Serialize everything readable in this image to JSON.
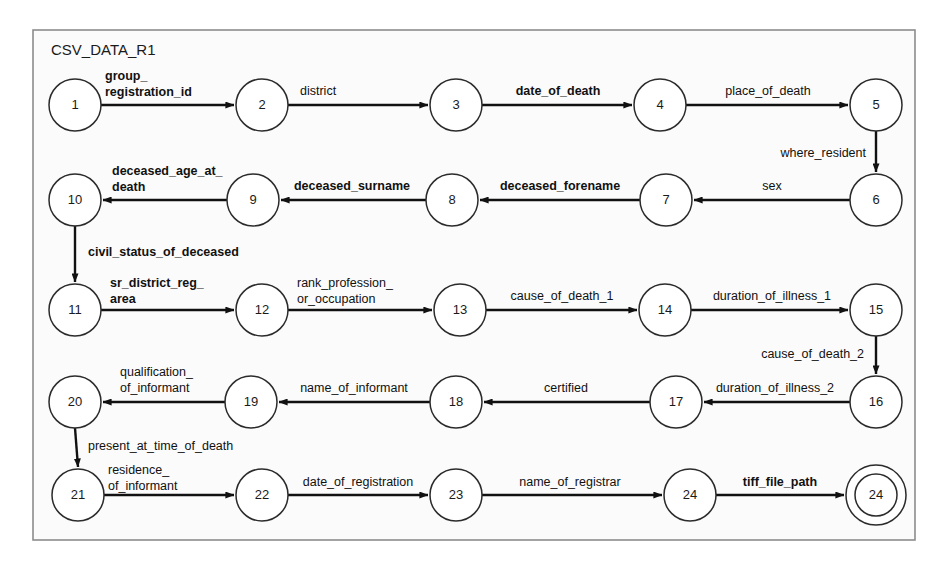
{
  "diagram": {
    "title": "CSV_DATA_R1",
    "type": "finite-state-machine",
    "frame": {
      "x": 33,
      "y": 30,
      "width": 882,
      "height": 510,
      "border_color": "#8d8d8d",
      "fill_color": "#fbfbfb"
    },
    "node_radius": 26,
    "accepting_inner_radius": 21,
    "edge_color": "#111111",
    "node_stroke_color": "#2b2b2b",
    "nodes": [
      {
        "id": "n1",
        "label": "1",
        "cx": 75,
        "cy": 105,
        "accepting": false
      },
      {
        "id": "n2",
        "label": "2",
        "cx": 262,
        "cy": 105,
        "accepting": false
      },
      {
        "id": "n3",
        "label": "3",
        "cx": 456,
        "cy": 105,
        "accepting": false
      },
      {
        "id": "n4",
        "label": "4",
        "cx": 660,
        "cy": 105,
        "accepting": false
      },
      {
        "id": "n5",
        "label": "5",
        "cx": 876,
        "cy": 105,
        "accepting": false
      },
      {
        "id": "n6",
        "label": "6",
        "cx": 876,
        "cy": 200,
        "accepting": false
      },
      {
        "id": "n7",
        "label": "7",
        "cx": 666,
        "cy": 200,
        "accepting": false
      },
      {
        "id": "n8",
        "label": "8",
        "cx": 452,
        "cy": 200,
        "accepting": false
      },
      {
        "id": "n9",
        "label": "9",
        "cx": 253,
        "cy": 200,
        "accepting": false
      },
      {
        "id": "n10",
        "label": "10",
        "cx": 75,
        "cy": 200,
        "accepting": false
      },
      {
        "id": "n11",
        "label": "11",
        "cx": 75,
        "cy": 310,
        "accepting": false
      },
      {
        "id": "n12",
        "label": "12",
        "cx": 262,
        "cy": 310,
        "accepting": false
      },
      {
        "id": "n13",
        "label": "13",
        "cx": 460,
        "cy": 310,
        "accepting": false
      },
      {
        "id": "n14",
        "label": "14",
        "cx": 665,
        "cy": 310,
        "accepting": false
      },
      {
        "id": "n15",
        "label": "15",
        "cx": 876,
        "cy": 310,
        "accepting": false
      },
      {
        "id": "n16",
        "label": "16",
        "cx": 876,
        "cy": 402,
        "accepting": false
      },
      {
        "id": "n17",
        "label": "17",
        "cx": 676,
        "cy": 402,
        "accepting": false
      },
      {
        "id": "n18",
        "label": "18",
        "cx": 456,
        "cy": 402,
        "accepting": false
      },
      {
        "id": "n19",
        "label": "19",
        "cx": 251,
        "cy": 402,
        "accepting": false
      },
      {
        "id": "n20",
        "label": "20",
        "cx": 75,
        "cy": 402,
        "accepting": false
      },
      {
        "id": "n21",
        "label": "21",
        "cx": 78,
        "cy": 495,
        "accepting": false
      },
      {
        "id": "n22",
        "label": "22",
        "cx": 262,
        "cy": 495,
        "accepting": false
      },
      {
        "id": "n23",
        "label": "23",
        "cx": 456,
        "cy": 495,
        "accepting": false
      },
      {
        "id": "n24",
        "label": "24",
        "cx": 690,
        "cy": 495,
        "accepting": false
      },
      {
        "id": "n24f",
        "label": "24",
        "cx": 876,
        "cy": 495,
        "accepting": true
      }
    ],
    "edges": [
      {
        "id": "e1",
        "from": "n1",
        "to": "n2",
        "label": "group_\nregistration_id",
        "bold": true,
        "dir": "right",
        "label_x": 105,
        "label_y": 80,
        "anchor": "start"
      },
      {
        "id": "e2",
        "from": "n2",
        "to": "n3",
        "label": "district",
        "bold": false,
        "dir": "right",
        "label_x": 300,
        "label_y": 95,
        "anchor": "start"
      },
      {
        "id": "e3",
        "from": "n3",
        "to": "n4",
        "label": "date_of_death",
        "bold": true,
        "dir": "right",
        "label_x": 558,
        "label_y": 95,
        "anchor": "middle"
      },
      {
        "id": "e4",
        "from": "n4",
        "to": "n5",
        "label": "place_of_death",
        "bold": false,
        "dir": "right",
        "label_x": 768,
        "label_y": 95,
        "anchor": "middle"
      },
      {
        "id": "e5",
        "from": "n5",
        "to": "n6",
        "label": "where_resident",
        "bold": false,
        "dir": "down",
        "label_x": 866,
        "label_y": 157,
        "anchor": "end"
      },
      {
        "id": "e6",
        "from": "n6",
        "to": "n7",
        "label": "sex",
        "bold": false,
        "dir": "left",
        "label_x": 772,
        "label_y": 190,
        "anchor": "middle"
      },
      {
        "id": "e7",
        "from": "n7",
        "to": "n8",
        "label": "deceased_forename",
        "bold": true,
        "dir": "left",
        "label_x": 560,
        "label_y": 190,
        "anchor": "middle"
      },
      {
        "id": "e8",
        "from": "n8",
        "to": "n9",
        "label": "deceased_surname",
        "bold": true,
        "dir": "left",
        "label_x": 352,
        "label_y": 190,
        "anchor": "middle"
      },
      {
        "id": "e9",
        "from": "n9",
        "to": "n10",
        "label": "deceased_age_at_\ndeath",
        "bold": true,
        "dir": "left",
        "label_x": 112,
        "label_y": 175,
        "anchor": "start"
      },
      {
        "id": "e10",
        "from": "n10",
        "to": "n11",
        "label": "civil_status_of_deceased",
        "bold": true,
        "dir": "down",
        "label_x": 88,
        "label_y": 256,
        "anchor": "start"
      },
      {
        "id": "e11",
        "from": "n11",
        "to": "n12",
        "label": "sr_district_reg_\narea",
        "bold": true,
        "dir": "right",
        "label_x": 110,
        "label_y": 287,
        "anchor": "start"
      },
      {
        "id": "e12",
        "from": "n12",
        "to": "n13",
        "label": "rank_profession_\nor_occupation",
        "bold": false,
        "dir": "right",
        "label_x": 297,
        "label_y": 287,
        "anchor": "start"
      },
      {
        "id": "e13",
        "from": "n13",
        "to": "n14",
        "label": "cause_of_death_1",
        "bold": false,
        "dir": "right",
        "label_x": 562,
        "label_y": 300,
        "anchor": "middle"
      },
      {
        "id": "e14",
        "from": "n14",
        "to": "n15",
        "label": "duration_of_illness_1",
        "bold": false,
        "dir": "right",
        "label_x": 772,
        "label_y": 300,
        "anchor": "middle"
      },
      {
        "id": "e15",
        "from": "n15",
        "to": "n16",
        "label": "cause_of_death_2",
        "bold": false,
        "dir": "down",
        "label_x": 864,
        "label_y": 358,
        "anchor": "end"
      },
      {
        "id": "e16",
        "from": "n16",
        "to": "n17",
        "label": "duration_of_illness_2",
        "bold": false,
        "dir": "left",
        "label_x": 775,
        "label_y": 392,
        "anchor": "middle"
      },
      {
        "id": "e17",
        "from": "n17",
        "to": "n18",
        "label": "certified",
        "bold": false,
        "dir": "left",
        "label_x": 566,
        "label_y": 392,
        "anchor": "middle"
      },
      {
        "id": "e18",
        "from": "n18",
        "to": "n19",
        "label": "name_of_informant",
        "bold": false,
        "dir": "left",
        "label_x": 354,
        "label_y": 392,
        "anchor": "middle"
      },
      {
        "id": "e19",
        "from": "n19",
        "to": "n20",
        "label": "qualification_\nof_informant",
        "bold": false,
        "dir": "left",
        "label_x": 120,
        "label_y": 376,
        "anchor": "start"
      },
      {
        "id": "e20",
        "from": "n20",
        "to": "n21",
        "label": "present_at_time_of_death",
        "bold": false,
        "dir": "down",
        "label_x": 88,
        "label_y": 450,
        "anchor": "start"
      },
      {
        "id": "e21",
        "from": "n21",
        "to": "n22",
        "label": "residence_\nof_informant",
        "bold": false,
        "dir": "right",
        "label_x": 108,
        "label_y": 474,
        "anchor": "start"
      },
      {
        "id": "e22",
        "from": "n22",
        "to": "n23",
        "label": "date_of_registration",
        "bold": false,
        "dir": "right",
        "label_x": 358,
        "label_y": 486,
        "anchor": "middle"
      },
      {
        "id": "e23",
        "from": "n23",
        "to": "n24",
        "label": "name_of_registrar",
        "bold": false,
        "dir": "right",
        "label_x": 570,
        "label_y": 486,
        "anchor": "middle"
      },
      {
        "id": "e24",
        "from": "n24",
        "to": "n24f",
        "label": "tiff_file_path",
        "bold": true,
        "dir": "right",
        "label_x": 780,
        "label_y": 486,
        "anchor": "middle"
      }
    ]
  }
}
